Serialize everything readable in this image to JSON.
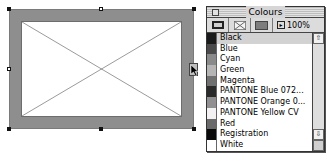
{
  "canvas": {
    "frame": {
      "type": "picture-frame-empty",
      "border_color": "#8e8e8e",
      "inner_fill": "#ffffff"
    }
  },
  "palette": {
    "title": "Colours",
    "toolbar": {
      "frame_icon": "frame-color-icon",
      "none_icon": "no-color-icon",
      "fill_icon": "fill-color-icon",
      "shade_arrow": "▸",
      "shade_value": "100%"
    },
    "colors": [
      {
        "label": "Black",
        "swatch": "#1a1a1a",
        "selected": true
      },
      {
        "label": "Blue",
        "swatch": "#4a4a4a"
      },
      {
        "label": "Cyan",
        "swatch": "#8a8a8a"
      },
      {
        "label": "Green",
        "swatch": "#b5b5b5"
      },
      {
        "label": "Magenta",
        "swatch": "#707070"
      },
      {
        "label": "PANTONE Blue 072...",
        "swatch": "#2a2a2a"
      },
      {
        "label": "PANTONE Orange 0...",
        "swatch": "#909090"
      },
      {
        "label": "PANTONE Yellow CV",
        "swatch": "#f2f2f2"
      },
      {
        "label": "Red",
        "swatch": "#6a6a6a"
      },
      {
        "label": "Registration",
        "swatch": "#0a0a0a"
      },
      {
        "label": "White",
        "swatch": "#ffffff"
      },
      {
        "label": "Yellow",
        "swatch": "#f4f4f4"
      }
    ],
    "scroll_up": "⇧",
    "scroll_down": "⇩"
  }
}
